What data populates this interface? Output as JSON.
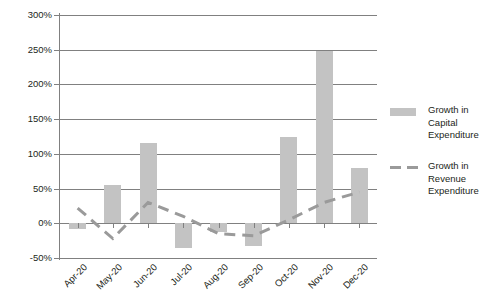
{
  "chart_data": {
    "type": "bar",
    "title": "",
    "xlabel": "",
    "ylabel": "",
    "ylim": [
      -50,
      300
    ],
    "ytick_step": 50,
    "grid": true,
    "legend_position": "right",
    "categories": [
      "Apr-20",
      "May-20",
      "Jun-20",
      "Jul-20",
      "Aug-20",
      "Sep-20",
      "Oct-20",
      "Nov-20",
      "Dec-20"
    ],
    "ytick_labels": [
      "300%",
      "250%",
      "200%",
      "150%",
      "100%",
      "50%",
      "0%",
      "-50%"
    ],
    "ytick_values": [
      300,
      250,
      200,
      150,
      100,
      50,
      0,
      -50
    ],
    "series": [
      {
        "name": "Growth in Capital Expenditure",
        "type": "bar",
        "color": "#c3c3c3",
        "values": [
          -8,
          55,
          115,
          -35,
          -13,
          -33,
          125,
          248,
          80
        ]
      },
      {
        "name": "Growth in Revenue Expenditure",
        "type": "line",
        "style": "dashed",
        "color": "#9a9a9a",
        "values": [
          22,
          -22,
          30,
          10,
          -15,
          -18,
          5,
          30,
          45
        ]
      }
    ]
  },
  "legend": {
    "entries": [
      {
        "label": "Growth in Capital Expenditure",
        "swatch": "bar-swatch"
      },
      {
        "label": "Growth in Revenue Expenditure",
        "swatch": "dashed-line-swatch"
      }
    ]
  }
}
